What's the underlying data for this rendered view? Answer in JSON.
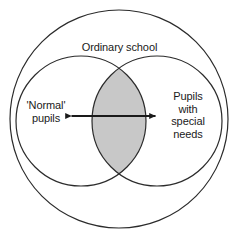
{
  "diagram": {
    "title_label": "Ordinary school",
    "left_label_lines": [
      "'Normal'",
      "pupils"
    ],
    "right_label_lines": [
      "Pupils",
      "with",
      "special",
      "needs"
    ],
    "colors": {
      "background": "#ffffff",
      "stroke": "#2b2b2b",
      "intersection_fill": "#c8c8c8",
      "arrow": "#1a1a1a",
      "text": "#1a1a1a"
    },
    "shapes": {
      "outer_circle": {
        "cx": 119,
        "cy": 119,
        "r": 109
      },
      "left_circle": {
        "cx": 81,
        "cy": 121,
        "r": 65
      },
      "right_circle": {
        "cx": 157,
        "cy": 121,
        "r": 65
      },
      "arrow": {
        "x1": 70,
        "x2": 157,
        "y": 116
      }
    }
  }
}
